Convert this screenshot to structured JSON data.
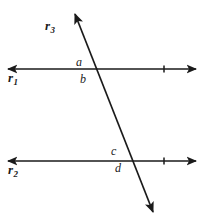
{
  "figure": {
    "kind": "geometry-diagram",
    "width": 203,
    "height": 223,
    "background_color": "#ffffff",
    "stroke_color": "#1a1a1a",
    "stroke_width": 1.6
  },
  "lines": {
    "r1": {
      "label": "r",
      "subscript": "1",
      "orientation": "horizontal",
      "y": 69,
      "x_start": 8,
      "x_end": 196,
      "arrow_start": true,
      "arrow_end": true,
      "tick_x": 164
    },
    "r2": {
      "label": "r",
      "subscript": "2",
      "orientation": "horizontal",
      "y": 161,
      "x_start": 8,
      "x_end": 196,
      "arrow_start": true,
      "arrow_end": true,
      "tick_x": 164
    },
    "r3": {
      "label": "r",
      "subscript": "3",
      "orientation": "transversal",
      "x_start": 75,
      "y_start": 14,
      "x_end": 153,
      "y_end": 212,
      "arrow_start": true,
      "arrow_end": true
    }
  },
  "intersections": [
    {
      "name": "upper",
      "x": 95,
      "y": 69,
      "lines": [
        "r1",
        "r3"
      ]
    },
    {
      "name": "lower",
      "x": 131,
      "y": 161,
      "lines": [
        "r2",
        "r3"
      ]
    }
  ],
  "angle_labels": [
    {
      "id": "a",
      "text": "a",
      "x": 79,
      "y": 62,
      "at": "upper",
      "position": "above-left"
    },
    {
      "id": "b",
      "text": "b",
      "x": 83,
      "y": 79,
      "at": "upper",
      "position": "below-left"
    },
    {
      "id": "c",
      "text": "c",
      "x": 114,
      "y": 151,
      "at": "lower",
      "position": "above-left"
    },
    {
      "id": "d",
      "text": "d",
      "x": 118,
      "y": 168,
      "at": "lower",
      "position": "below-left"
    }
  ],
  "line_labels": {
    "r1_base": "r",
    "r1_sub": "1",
    "r2_base": "r",
    "r2_sub": "2",
    "r3_base": "r",
    "r3_sub": "3"
  }
}
